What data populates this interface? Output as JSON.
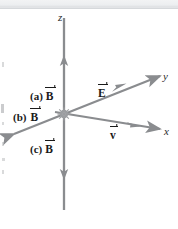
{
  "figure": {
    "type": "physics-vector-diagram",
    "background_color": "#ffffff",
    "axis_color": "#8a8c8f",
    "label_color": "#1a1a1a",
    "axes": [
      {
        "name": "z",
        "label": "z",
        "direction": "vertical",
        "arrowheads": "both"
      },
      {
        "name": "y",
        "label": "y",
        "direction": "upper-right-to-lower-left",
        "arrowheads": "both"
      },
      {
        "name": "x",
        "label": "x",
        "direction": "right-and-slightly-down",
        "arrowheads": "right"
      }
    ],
    "vectors": [
      {
        "name": "E",
        "label": "E",
        "along_axis": "y",
        "direction": "positive"
      },
      {
        "name": "v",
        "label": "v",
        "along_axis": "x",
        "direction": "positive"
      }
    ],
    "options": [
      {
        "key": "(a)",
        "label": "(a)",
        "symbol": "B"
      },
      {
        "key": "(b)",
        "label": "(b)",
        "symbol": "B"
      },
      {
        "key": "(c)",
        "label": "(c)",
        "symbol": "B"
      }
    ],
    "origin_marker": "star-burst"
  }
}
